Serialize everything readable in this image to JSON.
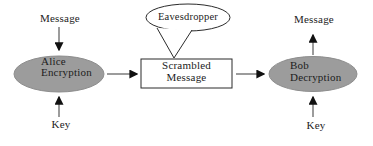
{
  "diagram": {
    "left": {
      "input_label": "Message",
      "node_label": "Alice\nEncryption",
      "key_label": "Key"
    },
    "center": {
      "bubble_label": "Eavesdropper",
      "box_label": "Scrambled\nMessage"
    },
    "right": {
      "node_label": "Bob\nDecryption",
      "output_label": "Message",
      "key_label": "Key"
    },
    "colors": {
      "background": "#ffffff",
      "node_fill": "#9c9c9c",
      "node_edge": "#8d8d8d",
      "outline": "#2b2b2b",
      "arrow_shaft": "#5a5a5a",
      "arrow_head": "#111111",
      "text": "#1c1c1c"
    }
  }
}
